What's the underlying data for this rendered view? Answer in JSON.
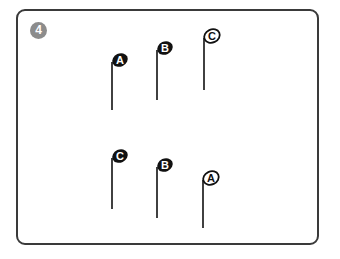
{
  "step": {
    "number": "4",
    "color": "#8c8c8c"
  },
  "top_row": [
    {
      "label": "A",
      "style": "filled",
      "x": 112,
      "head_y": 62,
      "stem_bottom": 110
    },
    {
      "label": "B",
      "style": "filled",
      "x": 157,
      "head_y": 50,
      "stem_bottom": 100
    },
    {
      "label": "C",
      "style": "outline",
      "x": 204,
      "head_y": 38,
      "stem_bottom": 90
    }
  ],
  "bottom_row": [
    {
      "label": "C",
      "style": "filled",
      "x": 112,
      "head_y": 158,
      "stem_bottom": 209
    },
    {
      "label": "B",
      "style": "filled",
      "x": 157,
      "head_y": 167,
      "stem_bottom": 218
    },
    {
      "label": "A",
      "style": "outline",
      "x": 203,
      "head_y": 180,
      "stem_bottom": 228
    }
  ]
}
